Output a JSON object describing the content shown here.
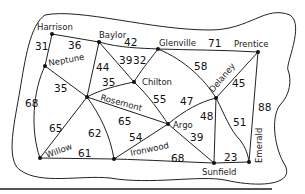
{
  "diagram": {
    "type": "weighted-graph",
    "nodes": [
      {
        "id": "harrison",
        "label": "Harrison",
        "x": 52,
        "y": 34
      },
      {
        "id": "baylor",
        "label": "Baylor",
        "x": 99,
        "y": 42
      },
      {
        "id": "neptune",
        "label": "Neptune",
        "x": 45,
        "y": 66
      },
      {
        "id": "glenville",
        "label": "Glenville",
        "x": 158,
        "y": 49
      },
      {
        "id": "prentice",
        "label": "Prentice",
        "x": 258,
        "y": 52
      },
      {
        "id": "chilton",
        "label": "Chilton",
        "x": 134,
        "y": 82
      },
      {
        "id": "rosemont",
        "label": "Rosemont",
        "x": 87,
        "y": 97
      },
      {
        "id": "delaney",
        "label": "Delaney",
        "x": 216,
        "y": 98
      },
      {
        "id": "argo",
        "label": "Argo",
        "x": 168,
        "y": 124
      },
      {
        "id": "willow",
        "label": "Willow",
        "x": 40,
        "y": 158
      },
      {
        "id": "ironwood",
        "label": "Ironwood",
        "x": 114,
        "y": 159
      },
      {
        "id": "sunfield",
        "label": "Sunfield",
        "x": 214,
        "y": 163
      },
      {
        "id": "emerald",
        "label": "Emerald",
        "x": 249,
        "y": 162
      }
    ],
    "edges": [
      {
        "from": "harrison",
        "to": "baylor",
        "weight": "36"
      },
      {
        "from": "harrison",
        "to": "neptune",
        "weight": "31"
      },
      {
        "from": "neptune",
        "to": "willow",
        "weight": "68"
      },
      {
        "from": "neptune",
        "to": "rosemont",
        "weight": "35"
      },
      {
        "from": "baylor",
        "to": "rosemont",
        "weight": "44"
      },
      {
        "from": "baylor",
        "to": "chilton",
        "weight": "39"
      },
      {
        "from": "baylor",
        "to": "glenville",
        "weight": "42"
      },
      {
        "from": "glenville",
        "to": "chilton",
        "weight": "32"
      },
      {
        "from": "glenville",
        "to": "prentice",
        "weight": "71"
      },
      {
        "from": "glenville",
        "to": "delaney",
        "weight": "58"
      },
      {
        "from": "prentice",
        "to": "delaney",
        "weight": "45"
      },
      {
        "from": "prentice",
        "to": "emerald",
        "weight": "88"
      },
      {
        "from": "chilton",
        "to": "rosemont",
        "weight": "35"
      },
      {
        "from": "chilton",
        "to": "argo",
        "weight": "55"
      },
      {
        "from": "rosemont",
        "to": "argo",
        "weight": "65"
      },
      {
        "from": "rosemont",
        "to": "willow",
        "weight": "65"
      },
      {
        "from": "rosemont",
        "to": "ironwood",
        "weight": "62"
      },
      {
        "from": "willow",
        "to": "ironwood",
        "weight": "61"
      },
      {
        "from": "ironwood",
        "to": "argo",
        "weight": "54"
      },
      {
        "from": "ironwood",
        "to": "sunfield",
        "weight": "68"
      },
      {
        "from": "argo",
        "to": "delaney",
        "weight": "47"
      },
      {
        "from": "argo",
        "to": "sunfield",
        "weight": "39"
      },
      {
        "from": "delaney",
        "to": "sunfield",
        "weight": "48"
      },
      {
        "from": "delaney",
        "to": "emerald",
        "weight": "51"
      },
      {
        "from": "sunfield",
        "to": "emerald",
        "weight": "23"
      }
    ]
  }
}
